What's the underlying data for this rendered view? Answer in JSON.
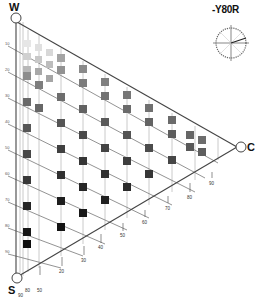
{
  "diagram": {
    "title": "-Y80R",
    "hue": "Y80R",
    "vertices": {
      "white": "W",
      "black": "S",
      "chromatic": "C"
    },
    "blackness_labels": [
      "10",
      "20",
      "30",
      "40",
      "50",
      "60",
      "70",
      "80",
      "90"
    ],
    "chromaticness_labels": [
      "10",
      "20",
      "30",
      "40",
      "50",
      "60",
      "70",
      "80",
      "90"
    ],
    "bottom_left_labels": [
      "90",
      "80",
      "50"
    ],
    "colors": {
      "line": "#555555",
      "grid": "#bbbbbb",
      "swatch_light": "#c8c8c8",
      "swatch_mid": "#7a7a7a",
      "swatch_dark": "#3a3a3a",
      "swatch_black": "#111111"
    }
  }
}
